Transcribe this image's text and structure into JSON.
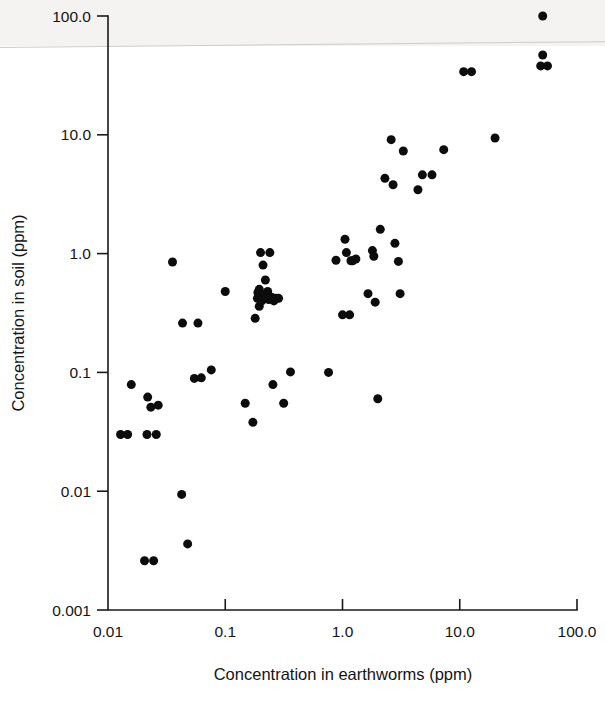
{
  "chart_data": {
    "type": "scatter",
    "title": "",
    "xlabel": "Concentration in earthworms (ppm)",
    "ylabel": "Concentration in soil (ppm)",
    "xscale": "log",
    "yscale": "log",
    "xlim": [
      0.01,
      100.0
    ],
    "ylim": [
      0.001,
      100.0
    ],
    "grid": false,
    "legend": null,
    "xticks": [
      "0.01",
      "0.1",
      "1.0",
      "10.0",
      "100.0"
    ],
    "xtick_values": [
      0.01,
      0.1,
      1.0,
      10.0,
      100.0
    ],
    "yticks": [
      "0.001",
      "0.01",
      "0.1",
      "1.0",
      "10.0",
      "100.0"
    ],
    "ytick_values": [
      0.001,
      0.01,
      0.1,
      1.0,
      10.0,
      100.0
    ],
    "marker": "filled-circle",
    "marker_color": "#0c0c0c",
    "marker_size_px": 9,
    "n_points": 76,
    "points": [
      [
        0.0128,
        0.03
      ],
      [
        0.0147,
        0.03
      ],
      [
        0.0158,
        0.079
      ],
      [
        0.0205,
        0.0026
      ],
      [
        0.0215,
        0.03
      ],
      [
        0.0218,
        0.062
      ],
      [
        0.0232,
        0.051
      ],
      [
        0.0245,
        0.0026
      ],
      [
        0.0258,
        0.03
      ],
      [
        0.0268,
        0.053
      ],
      [
        0.0355,
        0.85
      ],
      [
        0.0425,
        0.0094
      ],
      [
        0.0432,
        0.26
      ],
      [
        0.0478,
        0.0036
      ],
      [
        0.0545,
        0.089
      ],
      [
        0.0585,
        0.26
      ],
      [
        0.0625,
        0.09
      ],
      [
        0.076,
        0.105
      ],
      [
        0.1,
        0.48
      ],
      [
        0.148,
        0.055
      ],
      [
        0.172,
        0.038
      ],
      [
        0.18,
        0.285
      ],
      [
        0.188,
        0.42
      ],
      [
        0.19,
        0.47
      ],
      [
        0.195,
        0.36
      ],
      [
        0.198,
        0.44
      ],
      [
        0.2,
        1.02
      ],
      [
        0.21,
        0.8
      ],
      [
        0.215,
        0.44
      ],
      [
        0.22,
        0.6
      ],
      [
        0.225,
        0.46
      ],
      [
        0.23,
        0.48
      ],
      [
        0.235,
        0.41
      ],
      [
        0.24,
        1.02
      ],
      [
        0.248,
        0.43
      ],
      [
        0.255,
        0.079
      ],
      [
        0.27,
        0.42
      ],
      [
        0.285,
        0.42
      ],
      [
        0.315,
        0.055
      ],
      [
        0.36,
        0.101
      ],
      [
        0.76,
        0.1
      ],
      [
        0.88,
        0.88
      ],
      [
        1.0,
        0.305
      ],
      [
        1.05,
        1.32
      ],
      [
        1.08,
        1.02
      ],
      [
        1.15,
        0.305
      ],
      [
        1.18,
        0.87
      ],
      [
        1.22,
        0.87
      ],
      [
        1.3,
        0.9
      ],
      [
        1.65,
        0.46
      ],
      [
        1.8,
        1.06
      ],
      [
        1.85,
        0.95
      ],
      [
        1.9,
        0.39
      ],
      [
        2.0,
        0.06
      ],
      [
        2.1,
        1.6
      ],
      [
        2.3,
        4.3
      ],
      [
        2.6,
        9.1
      ],
      [
        2.7,
        3.8
      ],
      [
        2.8,
        1.22
      ],
      [
        3.0,
        0.86
      ],
      [
        3.1,
        0.46
      ],
      [
        3.3,
        7.3
      ],
      [
        4.4,
        3.45
      ],
      [
        4.8,
        4.6
      ],
      [
        5.8,
        4.6
      ],
      [
        7.3,
        7.5
      ],
      [
        10.8,
        34.0
      ],
      [
        12.6,
        34.0
      ],
      [
        20.0,
        9.4
      ],
      [
        51.0,
        100.0
      ],
      [
        51.0,
        47.0
      ],
      [
        49.0,
        38.0
      ],
      [
        56.0,
        38.0
      ],
      [
        0.195,
        0.5
      ],
      [
        0.205,
        0.4
      ],
      [
        0.26,
        0.4
      ]
    ]
  },
  "axes": {
    "y_title": "Concentration in soil (ppm)",
    "x_title": "Concentration in earthworms (ppm)"
  },
  "figure": {
    "background_color": "#ffffff",
    "ink_color": "#0c0c0c"
  }
}
